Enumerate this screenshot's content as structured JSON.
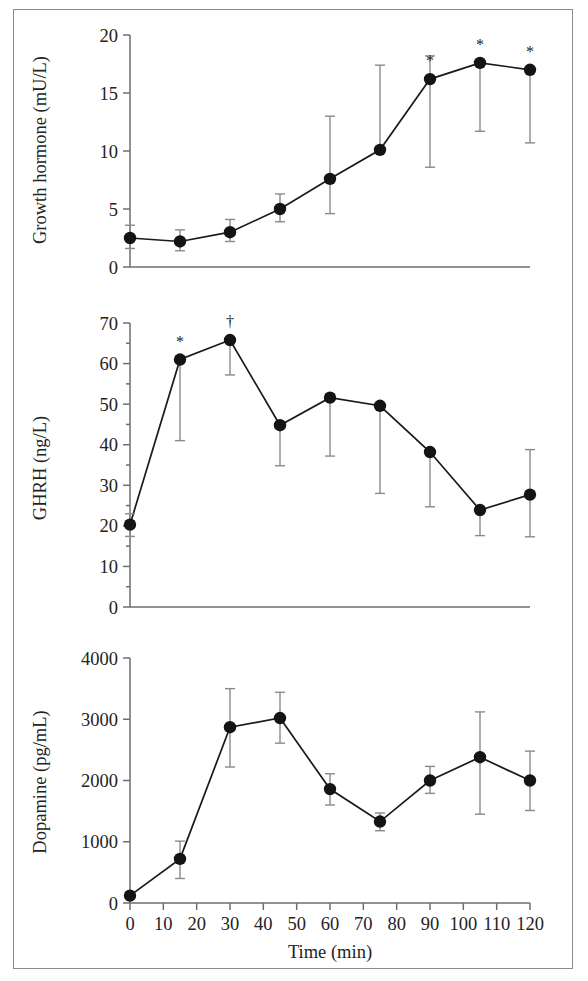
{
  "figure": {
    "background_color": "#ffffff",
    "frame_color": "#8d8d8d",
    "marker_color": "#141414",
    "line_color": "#1a1a1a",
    "errorbar_color": "#8a8a8a",
    "axis_color": "#6e6e6e",
    "shared_xlabel": "Time (min)",
    "x_tick_labels": [
      "0",
      "10",
      "20",
      "30",
      "40",
      "50",
      "60",
      "70",
      "80",
      "90",
      "100",
      "110",
      "120"
    ],
    "significance_note_star": "*",
    "significance_note_dagger": "†"
  },
  "chart_data": [
    {
      "type": "line",
      "panel": "a",
      "title": "",
      "xlabel": "",
      "ylabel": "Growth hormone (mU/L)",
      "xlim": [
        0,
        120
      ],
      "ylim": [
        0,
        20
      ],
      "xticks": [
        0,
        10,
        20,
        30,
        40,
        50,
        60,
        70,
        80,
        90,
        100,
        110,
        120
      ],
      "yticks": [
        0,
        5,
        10,
        15,
        20
      ],
      "ytick_labels": [
        "0",
        "5",
        "10",
        "15",
        "20"
      ],
      "grid": false,
      "legend": "none",
      "x": [
        0,
        15,
        30,
        45,
        60,
        75,
        90,
        105,
        120
      ],
      "values": [
        2.5,
        2.2,
        3.0,
        5.0,
        7.6,
        10.1,
        16.2,
        17.6,
        17.0
      ],
      "err_low": [
        1.6,
        1.4,
        2.2,
        3.9,
        4.6,
        10.1,
        8.6,
        11.7,
        10.7
      ],
      "err_high": [
        3.6,
        3.2,
        4.1,
        6.3,
        13.0,
        17.4,
        18.2,
        17.6,
        17.0
      ],
      "annotations": [
        {
          "x": 90,
          "text": "*"
        },
        {
          "x": 105,
          "text": "*"
        },
        {
          "x": 120,
          "text": "*"
        }
      ]
    },
    {
      "type": "line",
      "panel": "b",
      "title": "",
      "xlabel": "",
      "ylabel": "GHRH (ng/L)",
      "xlim": [
        0,
        120
      ],
      "ylim": [
        0,
        70
      ],
      "xticks": [
        0,
        10,
        20,
        30,
        40,
        50,
        60,
        70,
        80,
        90,
        100,
        110,
        120
      ],
      "yticks": [
        0,
        10,
        20,
        30,
        40,
        50,
        60,
        70
      ],
      "ytick_labels": [
        "0",
        "10",
        "20",
        "30",
        "40",
        "50",
        "60",
        "70"
      ],
      "grid": false,
      "legend": "none",
      "x": [
        0,
        15,
        30,
        45,
        60,
        75,
        90,
        105,
        120
      ],
      "values": [
        20.3,
        61.0,
        65.8,
        44.8,
        51.6,
        49.6,
        38.2,
        23.9,
        27.7
      ],
      "err_low": [
        17.4,
        41.0,
        57.2,
        34.8,
        37.2,
        28.0,
        24.7,
        17.6,
        17.3
      ],
      "err_high": [
        23.0,
        61.0,
        65.8,
        44.8,
        51.6,
        49.6,
        38.2,
        23.9,
        38.8
      ],
      "annotations": [
        {
          "x": 15,
          "text": "*"
        },
        {
          "x": 30,
          "text": "†"
        }
      ]
    },
    {
      "type": "line",
      "panel": "c",
      "title": "",
      "xlabel": "Time (min)",
      "ylabel": "Dopamine (pg/mL)",
      "xlim": [
        0,
        120
      ],
      "ylim": [
        0,
        4000
      ],
      "xticks": [
        0,
        10,
        20,
        30,
        40,
        50,
        60,
        70,
        80,
        90,
        100,
        110,
        120
      ],
      "yticks": [
        0,
        1000,
        2000,
        3000,
        4000
      ],
      "ytick_labels": [
        "0",
        "1000",
        "2000",
        "3000",
        "4000"
      ],
      "grid": false,
      "legend": "none",
      "x": [
        0,
        15,
        30,
        45,
        60,
        75,
        90,
        105,
        120
      ],
      "values": [
        120,
        720,
        2870,
        3020,
        1860,
        1330,
        2000,
        2380,
        2000
      ],
      "err_low": [
        120,
        400,
        2220,
        2610,
        1600,
        1180,
        1790,
        1450,
        1510
      ],
      "err_high": [
        120,
        1010,
        3500,
        3440,
        2110,
        1470,
        2230,
        3120,
        2480
      ],
      "annotations": []
    }
  ]
}
